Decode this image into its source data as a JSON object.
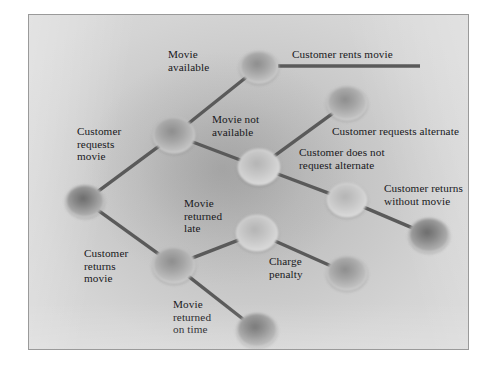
{
  "figure": {
    "type": "decision-tree-diagram",
    "background_color": "#c6c6c6",
    "node_color": "#9a9a9a",
    "edge_color": "#5a5a5a",
    "text_color": "#18181b"
  },
  "nodes": [
    {
      "id": "root",
      "name": "root-node",
      "x": 56,
      "y": 186,
      "rx": 19,
      "ry": 16,
      "shade": "dark"
    },
    {
      "id": "requests",
      "name": "customer-requests-node",
      "x": 145,
      "y": 120,
      "rx": 21,
      "ry": 18,
      "shade": "mid"
    },
    {
      "id": "rents",
      "name": "movie-rented-node",
      "x": 230,
      "y": 52,
      "rx": 19,
      "ry": 16,
      "shade": "mid"
    },
    {
      "id": "notavail",
      "name": "movie-not-available-node",
      "x": 230,
      "y": 152,
      "rx": 21,
      "ry": 18,
      "shade": "light"
    },
    {
      "id": "alternate",
      "name": "requests-alternate-node",
      "x": 318,
      "y": 88,
      "rx": 20,
      "ry": 17,
      "shade": "mid"
    },
    {
      "id": "noalternate",
      "name": "no-alternate-node",
      "x": 318,
      "y": 185,
      "rx": 20,
      "ry": 17,
      "shade": "light"
    },
    {
      "id": "returnswithout",
      "name": "returns-without-movie-node",
      "x": 400,
      "y": 220,
      "rx": 20,
      "ry": 17,
      "shade": "dark"
    },
    {
      "id": "returns",
      "name": "customer-returns-node",
      "x": 145,
      "y": 250,
      "rx": 21,
      "ry": 18,
      "shade": "mid"
    },
    {
      "id": "late",
      "name": "returned-late-node",
      "x": 228,
      "y": 218,
      "rx": 21,
      "ry": 18,
      "shade": "light"
    },
    {
      "id": "penalty",
      "name": "charge-penalty-node",
      "x": 318,
      "y": 258,
      "rx": 20,
      "ry": 17,
      "shade": "mid"
    },
    {
      "id": "ontime",
      "name": "returned-on-time-node",
      "x": 228,
      "y": 315,
      "rx": 20,
      "ry": 17,
      "shade": "dark"
    }
  ],
  "edges": [
    {
      "name": "edge-root-requests",
      "from": "root",
      "to": "requests"
    },
    {
      "name": "edge-root-returns",
      "from": "root",
      "to": "returns"
    },
    {
      "name": "edge-requests-rents",
      "from": "requests",
      "to": "rents"
    },
    {
      "name": "edge-requests-notavailable",
      "from": "requests",
      "to": "notavail"
    },
    {
      "name": "edge-notavailable-alternate",
      "from": "notavail",
      "to": "alternate"
    },
    {
      "name": "edge-notavailable-noalternate",
      "from": "notavail",
      "to": "noalternate"
    },
    {
      "name": "edge-noalternate-returns",
      "from": "noalternate",
      "to": "returnswithout"
    },
    {
      "name": "edge-returns-late",
      "from": "returns",
      "to": "late"
    },
    {
      "name": "edge-returns-ontime",
      "from": "returns",
      "to": "ontime"
    },
    {
      "name": "edge-late-penalty",
      "from": "late",
      "to": "penalty"
    }
  ],
  "outcome_line": {
    "name": "customer-rents-movie-outcome-line",
    "x1": 249,
    "y1": 51,
    "x2": 391,
    "y2": 51
  },
  "labels": [
    {
      "id": "l_requests_movie",
      "name": "label-customer-requests-movie",
      "text": "Customer\nrequests\nmovie",
      "x": 48,
      "y": 110,
      "align": "left"
    },
    {
      "id": "l_returns_movie",
      "name": "label-customer-returns-movie",
      "text": "Customer\nreturns\nmovie",
      "x": 55,
      "y": 232,
      "align": "left"
    },
    {
      "id": "l_available",
      "name": "label-movie-available",
      "text": "Movie\navailable",
      "x": 139,
      "y": 33,
      "align": "left"
    },
    {
      "id": "l_not_available",
      "name": "label-movie-not-available",
      "text": "Movie not\navailable",
      "x": 183,
      "y": 98,
      "align": "left"
    },
    {
      "id": "l_rents",
      "name": "label-customer-rents-movie",
      "text": "Customer rents movie",
      "x": 263,
      "y": 33,
      "align": "left"
    },
    {
      "id": "l_req_alt",
      "name": "label-customer-requests-alternate",
      "text": "Customer requests alternate",
      "x": 303,
      "y": 110,
      "align": "left"
    },
    {
      "id": "l_no_alt",
      "name": "label-customer-does-not-request-alternate",
      "text": "Customer does not\nrequest alternate",
      "x": 270,
      "y": 131,
      "align": "left"
    },
    {
      "id": "l_ret_without",
      "name": "label-customer-returns-without-movie",
      "text": "Customer returns\nwithout movie",
      "x": 355,
      "y": 167,
      "align": "left"
    },
    {
      "id": "l_late",
      "name": "label-movie-returned-late",
      "text": "Movie\nreturned\nlate",
      "x": 155,
      "y": 182,
      "align": "left"
    },
    {
      "id": "l_penalty",
      "name": "label-charge-penalty",
      "text": "Charge\npenalty",
      "x": 240,
      "y": 240,
      "align": "left"
    },
    {
      "id": "l_ontime",
      "name": "label-movie-returned-on-time",
      "text": "Movie\nreturned\non time",
      "x": 144,
      "y": 283,
      "align": "left"
    }
  ]
}
